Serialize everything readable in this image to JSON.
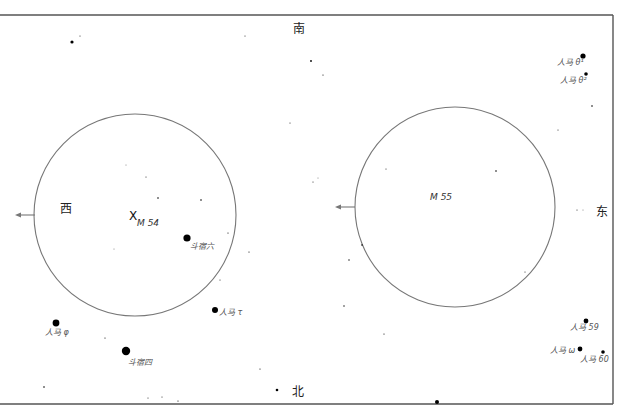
{
  "directions": {
    "south": "南",
    "north": "北",
    "west": "西",
    "east": "东"
  },
  "fields": [
    {
      "name": "M 54",
      "cx": 135,
      "cy": 215,
      "r": 101,
      "arrow_y": 215,
      "arrow_x1": 35,
      "arrow_x2": 15,
      "marker": "X"
    },
    {
      "name": "M 55",
      "cx": 455,
      "cy": 207,
      "r": 100,
      "arrow_y": 207,
      "arrow_x1": 355,
      "arrow_x2": 335
    }
  ],
  "labels": {
    "m54": "M 54",
    "m55": "M 55",
    "m54_marker": "X",
    "dou6": "斗宿六",
    "dou4": "斗宿四",
    "sgr_phi": "人马 φ",
    "sgr_tau": "人马 τ",
    "sgr_theta1": "人马 θ¹",
    "sgr_theta2": "人马 θ²",
    "sgr_59": "人马 59",
    "sgr_omega": "人马 ω",
    "sgr_60": "人马 60"
  },
  "named_stars": [
    {
      "id": "dou6",
      "x": 187,
      "y": 238,
      "r": 3.6
    },
    {
      "id": "dou4",
      "x": 126,
      "y": 351,
      "r": 4.2
    },
    {
      "id": "sgr_phi",
      "x": 56,
      "y": 323,
      "r": 3.4
    },
    {
      "id": "sgr_tau",
      "x": 215,
      "y": 310,
      "r": 3.0
    },
    {
      "id": "sgr_theta1",
      "x": 583,
      "y": 56,
      "r": 2.6
    },
    {
      "id": "sgr_theta2",
      "x": 586,
      "y": 74,
      "r": 1.8
    },
    {
      "id": "sgr_59",
      "x": 586,
      "y": 321,
      "r": 2.4
    },
    {
      "id": "sgr_omega",
      "x": 580,
      "y": 349,
      "r": 2.4
    },
    {
      "id": "sgr_60",
      "x": 603,
      "y": 352,
      "r": 1.8
    }
  ],
  "field_stars": [
    [
      72,
      42,
      1.6
    ],
    [
      80,
      36,
      0.5
    ],
    [
      245,
      36,
      0.5
    ],
    [
      311,
      61,
      0.9
    ],
    [
      323,
      75,
      0.6
    ],
    [
      290,
      123,
      0.5
    ],
    [
      158,
      198,
      0.8
    ],
    [
      201,
      200,
      0.8
    ],
    [
      146,
      177,
      0.5
    ],
    [
      126,
      165,
      0.4
    ],
    [
      228,
      233,
      0.6
    ],
    [
      249,
      252,
      0.6
    ],
    [
      220,
      280,
      0.5
    ],
    [
      114,
      249,
      0.4
    ],
    [
      386,
      169,
      0.5
    ],
    [
      496,
      171,
      0.8
    ],
    [
      362,
      245,
      0.8
    ],
    [
      349,
      260,
      0.7
    ],
    [
      525,
      272,
      0.5
    ],
    [
      592,
      106,
      0.8
    ],
    [
      558,
      130,
      0.5
    ],
    [
      577,
      210,
      0.5
    ],
    [
      583,
      210,
      0.4
    ],
    [
      344,
      306,
      0.7
    ],
    [
      384,
      334,
      0.6
    ],
    [
      105,
      338,
      0.6
    ],
    [
      44,
      387,
      0.8
    ],
    [
      260,
      369,
      0.6
    ],
    [
      277,
      390,
      1.3
    ],
    [
      437,
      402,
      2.0
    ],
    [
      148,
      398,
      0.5
    ],
    [
      162,
      397,
      0.5
    ],
    [
      178,
      401,
      0.6
    ],
    [
      313,
      182,
      0.5
    ],
    [
      318,
      178,
      0.4
    ]
  ],
  "colors": {
    "frame": "#555555",
    "circle": "#777777",
    "arrow": "#777777",
    "star": "#000000"
  }
}
